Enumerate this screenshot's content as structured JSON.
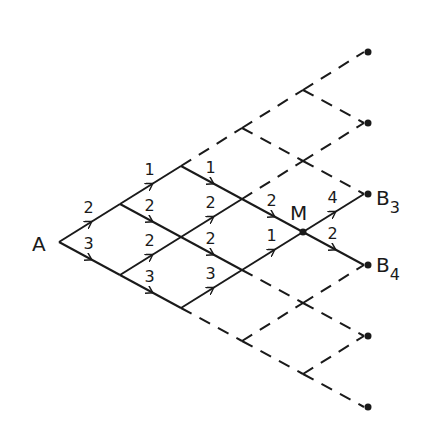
{
  "diagram": {
    "type": "lattice-path-graph",
    "origin": [
      59,
      242
    ],
    "up_step": [
      61,
      -38
    ],
    "down_step": [
      61,
      33
    ],
    "stroke_color": "#1a1a1a",
    "nodes": {
      "A": {
        "label": "A",
        "i": 0,
        "j": 0
      },
      "M": {
        "label": "M",
        "i": 2,
        "j": 2
      },
      "B3": {
        "label": "B",
        "sub": "3",
        "i": 3,
        "j": 2
      },
      "B4": {
        "label": "B",
        "sub": "4",
        "i": 2,
        "j": 3
      }
    },
    "solid_edges": [
      {
        "from": [
          0,
          0
        ],
        "to": [
          1,
          0
        ],
        "weight": "2"
      },
      {
        "from": [
          0,
          0
        ],
        "to": [
          0,
          1
        ],
        "weight": "3"
      },
      {
        "from": [
          1,
          0
        ],
        "to": [
          2,
          0
        ],
        "weight": "1"
      },
      {
        "from": [
          1,
          0
        ],
        "to": [
          1,
          1
        ],
        "weight": "2"
      },
      {
        "from": [
          0,
          1
        ],
        "to": [
          1,
          1
        ],
        "weight": "2"
      },
      {
        "from": [
          0,
          1
        ],
        "to": [
          0,
          2
        ],
        "weight": "3"
      },
      {
        "from": [
          2,
          0
        ],
        "to": [
          2,
          1
        ],
        "weight": "1"
      },
      {
        "from": [
          1,
          1
        ],
        "to": [
          2,
          1
        ],
        "weight": "2"
      },
      {
        "from": [
          1,
          1
        ],
        "to": [
          1,
          2
        ],
        "weight": "2"
      },
      {
        "from": [
          0,
          2
        ],
        "to": [
          1,
          2
        ],
        "weight": "3"
      },
      {
        "from": [
          2,
          1
        ],
        "to": [
          2,
          2
        ],
        "weight": "2"
      },
      {
        "from": [
          1,
          2
        ],
        "to": [
          2,
          2
        ],
        "weight": "1"
      },
      {
        "from": [
          2,
          2
        ],
        "to": [
          3,
          2
        ],
        "weight": "4"
      },
      {
        "from": [
          2,
          2
        ],
        "to": [
          2,
          3
        ],
        "weight": "2"
      }
    ],
    "dashed_edges": [
      {
        "from": [
          2,
          0
        ],
        "to": [
          3,
          0
        ]
      },
      {
        "from": [
          3,
          0
        ],
        "to": [
          4,
          0
        ]
      },
      {
        "from": [
          4,
          0
        ],
        "to": [
          5,
          0
        ]
      },
      {
        "from": [
          3,
          0
        ],
        "to": [
          3,
          1
        ]
      },
      {
        "from": [
          4,
          0
        ],
        "to": [
          4,
          1
        ]
      },
      {
        "from": [
          2,
          1
        ],
        "to": [
          3,
          1
        ]
      },
      {
        "from": [
          3,
          1
        ],
        "to": [
          4,
          1
        ]
      },
      {
        "from": [
          3,
          1
        ],
        "to": [
          3,
          2
        ]
      },
      {
        "from": [
          0,
          2
        ],
        "to": [
          0,
          3
        ]
      },
      {
        "from": [
          0,
          3
        ],
        "to": [
          0,
          4
        ]
      },
      {
        "from": [
          0,
          4
        ],
        "to": [
          0,
          5
        ]
      },
      {
        "from": [
          0,
          3
        ],
        "to": [
          1,
          3
        ]
      },
      {
        "from": [
          0,
          4
        ],
        "to": [
          1,
          4
        ]
      },
      {
        "from": [
          1,
          2
        ],
        "to": [
          1,
          3
        ]
      },
      {
        "from": [
          1,
          3
        ],
        "to": [
          1,
          4
        ]
      },
      {
        "from": [
          1,
          3
        ],
        "to": [
          2,
          3
        ]
      }
    ],
    "endpoints": [
      [
        5,
        0
      ],
      [
        4,
        1
      ],
      [
        3,
        2
      ],
      [
        2,
        3
      ],
      [
        1,
        4
      ],
      [
        0,
        5
      ]
    ]
  }
}
